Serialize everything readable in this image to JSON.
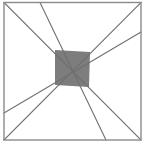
{
  "figure": {
    "type": "geometric-diagram",
    "canvas": {
      "width": 146,
      "height": 151
    },
    "background_color": "#ffffff",
    "colors": {
      "frame_stroke": "#8a8a8a",
      "line_stroke": "#6f6f6f",
      "shaded_fill": "#7d7d7d",
      "shaded_stroke": "#5a5a5a"
    },
    "stroke_widths": {
      "frame": 1.4,
      "line": 1.1
    },
    "frame": {
      "name": "outer-square",
      "x": 4,
      "y": 2.5,
      "width": 137,
      "height": 137.5,
      "corners": [
        {
          "label": "top-left",
          "x": 4,
          "y": 2.5
        },
        {
          "label": "top-right",
          "x": 141,
          "y": 2.5
        },
        {
          "label": "bottom-right",
          "x": 141,
          "y": 140
        },
        {
          "label": "bottom-left",
          "x": 4,
          "y": 140
        }
      ]
    },
    "lines": [
      {
        "name": "diagonal-top-left-to-bottom-right",
        "x1": 4,
        "y1": 2.5,
        "x2": 141,
        "y2": 140
      },
      {
        "name": "diagonal-bottom-left-to-top-right",
        "x1": 4,
        "y1": 140,
        "x2": 141,
        "y2": 2.5
      },
      {
        "name": "line-top-edge-to-bottom-edge",
        "x1": 40,
        "y1": 2.5,
        "x2": 106,
        "y2": 140
      },
      {
        "name": "line-left-edge-to-right-edge",
        "x1": 4,
        "y1": 113,
        "x2": 141,
        "y2": 32
      }
    ],
    "shaded_quadrilateral": {
      "name": "center-shaded-quadrilateral",
      "points": "55,50 90,52 89,87 55,85",
      "vertices": [
        {
          "label": "top-left",
          "x": 55,
          "y": 50
        },
        {
          "label": "top-right",
          "x": 90,
          "y": 52
        },
        {
          "label": "bottom-right",
          "x": 89,
          "y": 87
        },
        {
          "label": "bottom-left",
          "x": 55,
          "y": 85
        }
      ]
    }
  }
}
